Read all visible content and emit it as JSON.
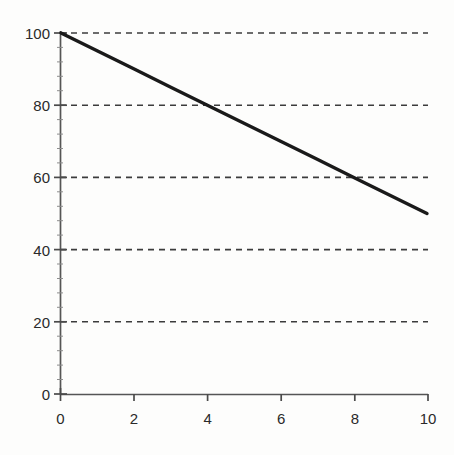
{
  "chart_data": {
    "type": "line",
    "title": "",
    "subtitle": "",
    "xlabel": "",
    "ylabel": "",
    "xlim": [
      0,
      10
    ],
    "ylim": [
      0,
      100
    ],
    "grid": true,
    "grid_axis": "y",
    "grid_style": "dashed",
    "legend": false,
    "legend_position": "none",
    "annotations": [],
    "x_ticks": [
      0,
      2,
      4,
      6,
      8,
      10
    ],
    "x_tick_labels": [
      "0",
      "2",
      "4",
      "6",
      "8",
      "10"
    ],
    "y_ticks": [
      0,
      20,
      40,
      60,
      80,
      100
    ],
    "y_tick_labels": [
      "0",
      "20",
      "40",
      "60",
      "80",
      "100"
    ],
    "gridline_values": [
      20,
      40,
      60,
      80,
      100
    ],
    "x": [
      0,
      1,
      2,
      3,
      4,
      5,
      6,
      7,
      8,
      9,
      10
    ],
    "series": [
      {
        "name": "",
        "values": [
          100,
          95,
          90,
          85,
          80,
          75,
          70,
          65,
          60,
          55,
          50
        ],
        "color": "#1a1a1a",
        "line_width": 3.4,
        "style": "solid"
      }
    ]
  },
  "style": {
    "background": "#fdfdfc",
    "axis_color": "#4a4a4a",
    "grid_color": "#3c3c3c",
    "tick_label_color": "#2a2a2a",
    "line_color": "#1a1a1a"
  }
}
